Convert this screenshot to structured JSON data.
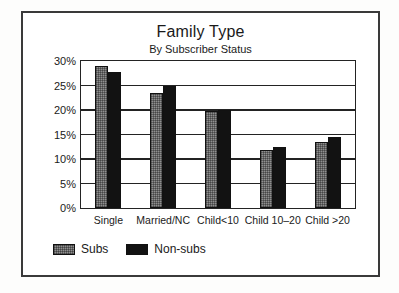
{
  "chart_data": {
    "type": "bar",
    "title": "Family Type",
    "subtitle": "By Subscriber Status",
    "xlabel": "",
    "ylabel": "",
    "ylim": [
      0,
      30
    ],
    "ytick_labels": [
      "0%",
      "5%",
      "10%",
      "15%",
      "20%",
      "25%",
      "30%"
    ],
    "ytick_values": [
      0,
      5,
      10,
      15,
      20,
      25,
      30
    ],
    "grid": true,
    "legend_position": "bottom-left",
    "categories": [
      "Single",
      "Married/NC",
      "Child<10",
      "Child 10–20",
      "Child >20"
    ],
    "series": [
      {
        "name": "Subs",
        "color": "#8f8f8f",
        "values": [
          29.0,
          23.5,
          19.8,
          11.8,
          13.4
        ]
      },
      {
        "name": "Non-subs",
        "color": "#121212",
        "values": [
          27.8,
          25.0,
          20.0,
          12.5,
          14.4
        ]
      }
    ]
  }
}
